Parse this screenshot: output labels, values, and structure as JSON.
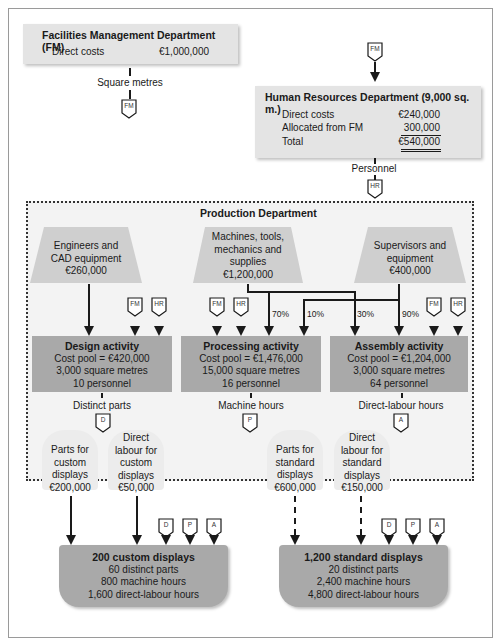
{
  "fm_department": {
    "title": "Facilities Management Department (FM)",
    "direct_costs_label": "Direct costs",
    "direct_costs_value": "€1,000,000",
    "driver": "Square metres",
    "tag": "FM"
  },
  "hr_department": {
    "incoming_tag": "FM",
    "title": "Human Resources Department (9,000 sq. m.)",
    "rows": [
      {
        "label": "Direct costs",
        "value": "€240,000"
      },
      {
        "label": "Allocated from FM",
        "value": "300,000"
      },
      {
        "label": "Total",
        "value": "€540,000"
      }
    ],
    "driver": "Personnel",
    "tag": "HR"
  },
  "production_department": {
    "title": "Production Department",
    "resources": [
      {
        "line1": "Engineers and",
        "line2": "CAD equipment",
        "line3": "€260,000"
      },
      {
        "line1": "Machines, tools,",
        "line2": "mechanics and",
        "line3": "supplies",
        "line4": "€1,200,000"
      },
      {
        "line1": "Supervisors and",
        "line2": "equipment",
        "line3": "€400,000"
      }
    ],
    "allocations": {
      "machines_to_processing": "70%",
      "supervisors_to_processing": "10%",
      "machines_to_assembly": "30%",
      "supervisors_to_assembly": "90%"
    },
    "service_tags": {
      "fm": "FM",
      "hr": "HR"
    },
    "activities": [
      {
        "title": "Design activity",
        "cost_pool": "Cost pool = €420,000",
        "area": "3,000 square metres",
        "personnel": "10 personnel",
        "driver": "Distinct parts",
        "tag": "D"
      },
      {
        "title": "Processing activity",
        "cost_pool": "Cost pool = €1,476,000",
        "area": "15,000 square metres",
        "personnel": "16 personnel",
        "driver": "Machine hours",
        "tag": "P"
      },
      {
        "title": "Assembly activity",
        "cost_pool": "Cost pool = €1,204,000",
        "area": "3,000 square metres",
        "personnel": "64 personnel",
        "driver": "Direct-labour hours",
        "tag": "A"
      }
    ],
    "direct_costs": [
      {
        "lines": [
          "Parts for",
          "custom",
          "displays",
          "€200,000"
        ]
      },
      {
        "lines": [
          "Direct",
          "labour for",
          "custom",
          "displays",
          "€50,000"
        ]
      },
      {
        "lines": [
          "Parts for",
          "standard",
          "displays",
          "€600,000"
        ]
      },
      {
        "lines": [
          "Direct",
          "labour for",
          "standard",
          "displays",
          "€150,000"
        ]
      }
    ]
  },
  "products": [
    {
      "title": "200 custom displays",
      "line1": "60 distinct parts",
      "line2": "800 machine hours",
      "line3": "1,600 direct-labour hours",
      "tags": [
        "D",
        "P",
        "A"
      ]
    },
    {
      "title": "1,200 standard displays",
      "line1": "20 distinct parts",
      "line2": "2,400 machine hours",
      "line3": "4,800 direct-labour hours",
      "tags": [
        "D",
        "P",
        "A"
      ]
    }
  ],
  "colors": {
    "light_box": "#e4e4e4",
    "dark_box": "#a9a9a9",
    "region_bg": "#f3f3f3",
    "line": "#1a1a1a"
  }
}
